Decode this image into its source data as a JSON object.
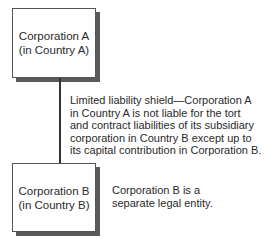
{
  "diagram": {
    "box_a": {
      "line1": "Corporation A",
      "line2": "(in Country A)"
    },
    "box_b": {
      "line1": "Corporation B",
      "line2": "(in Country B)"
    },
    "shield_note": {
      "lines": [
        "Limited liability shield—Corporation A",
        "in Country A is not liable for the tort",
        "and contract liabilities of its subsidiary",
        "corporation in Country B except up to",
        "its capital contribution in Corporation B."
      ]
    },
    "separate_note": {
      "lines": [
        "Corporation B is a",
        "separate legal entity."
      ]
    },
    "colors": {
      "border": "#555555",
      "shadow": "#5a5a5a",
      "text": "#2a2a2a",
      "line": "#333333"
    }
  }
}
